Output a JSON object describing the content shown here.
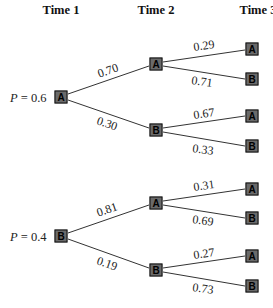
{
  "headers": [
    "Time 1",
    "Time 2",
    "Time 3"
  ],
  "trees": [
    {
      "prior_label": "P = 0.6",
      "prior_var": "P",
      "prior_value": "= 0.6",
      "root": "A",
      "branches": [
        {
          "prob": "0.70",
          "node": "A",
          "children": [
            {
              "prob": "0.29",
              "node": "A"
            },
            {
              "prob": "0.71",
              "node": "B"
            }
          ]
        },
        {
          "prob": "0.30",
          "node": "B",
          "children": [
            {
              "prob": "0.67",
              "node": "A"
            },
            {
              "prob": "0.33",
              "node": "B"
            }
          ]
        }
      ]
    },
    {
      "prior_label": "P = 0.4",
      "prior_var": "P",
      "prior_value": "= 0.4",
      "root": "B",
      "branches": [
        {
          "prob": "0.81",
          "node": "A",
          "children": [
            {
              "prob": "0.31",
              "node": "A"
            },
            {
              "prob": "0.69",
              "node": "B"
            }
          ]
        },
        {
          "prob": "0.19",
          "node": "B",
          "children": [
            {
              "prob": "0.27",
              "node": "A"
            },
            {
              "prob": "0.73",
              "node": "B"
            }
          ]
        }
      ]
    }
  ],
  "colors": {
    "node_fill": "#6a6a6a",
    "node_border": "#111111",
    "line": "#333333"
  }
}
